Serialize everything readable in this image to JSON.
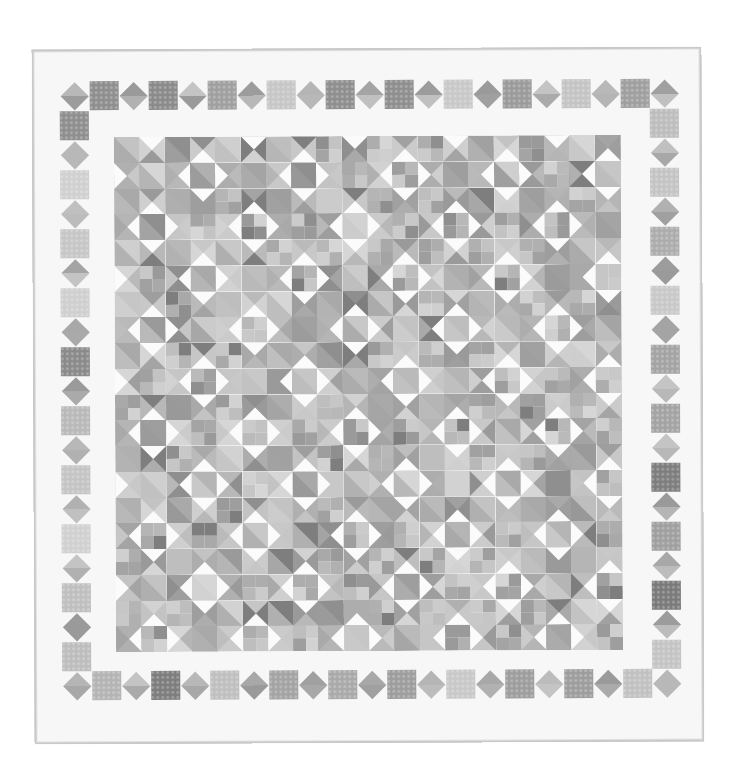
{
  "image": {
    "subject": "Scrappy grayscale patchwork quilt",
    "description": "Quilt with a white outer border featuring alternating on-point diamonds and squares, surrounding a center field of four-patch squares and half-square-triangle cells forming diamond and star motifs."
  },
  "colors": {
    "page_background": "#ffffff",
    "quilt_background": "#f7f7f7",
    "binding": "#c9c9c9",
    "white_triangle": "#fbfbfb"
  },
  "layout": {
    "quilt": {
      "x": 33,
      "y": 48,
      "w": 670,
      "h": 695
    },
    "border_items": {
      "origin_x": 28,
      "origin_y": 32,
      "pitch": 29.5,
      "size": 29,
      "count_x": 21,
      "count_y": 21
    },
    "inner": {
      "x": 82,
      "y": 88,
      "w": 506,
      "h": 515,
      "cols": 20,
      "rows": 20
    }
  },
  "tones": {
    "border_squares": [
      "#7a7a7a",
      "#b9b9b9",
      "#c4c4c4",
      "#bfbfbf",
      "#9d9d9d",
      "#8a8a8a",
      "#cfcfcf",
      "#c8c8c8",
      "#8e8e8e",
      "#9a9a9a",
      "#b4b4b4",
      "#a9a9a9",
      "#c1c1c1",
      "#9f9f9f",
      "#d0d0d0",
      "#7d7d7d",
      "#bdbdbd",
      "#acacac",
      "#c6c6c6",
      "#a3a3a3"
    ],
    "border_diamonds": [
      "#9a9a9a",
      "#b5b5b5",
      "#a8a8a8",
      "#c0c0c0",
      "#aaaaaa",
      "#b8b8b8",
      "#9c9c9c",
      "#c4c4c4",
      "#a4a4a4",
      "#bcbcbc",
      "#b1b1b1",
      "#a0a0a0"
    ],
    "prints": [
      "#c8c8c8",
      "#b5b5b5",
      "#a9a9a9",
      "#bebebe",
      "#9e9e9e",
      "#d2d2d2",
      "#b0b0b0",
      "#c3c3c3",
      "#8f8f8f",
      "#cbcbcb",
      "#a4a4a4",
      "#bababa",
      "#7e7e7e",
      "#d6d6d6",
      "#b8b8b8",
      "#9a9a9a",
      "#c6c6c6",
      "#adadad",
      "#cfcfcf",
      "#a1a1a1"
    ]
  }
}
